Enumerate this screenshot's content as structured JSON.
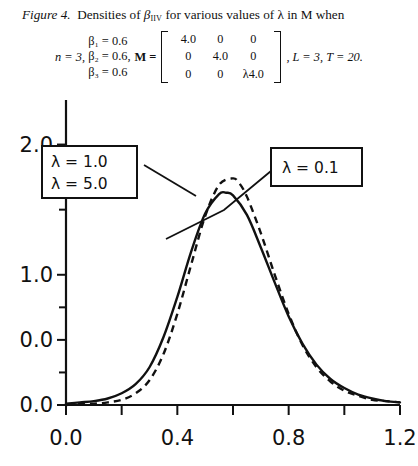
{
  "caption": {
    "figure_number": "Figure 4.",
    "text_before_symbol": "Densities of",
    "symbol_base": "β",
    "symbol_subscript": "IIV",
    "text_after_symbol": "for various values of λ in M when"
  },
  "equation": {
    "n_term": "n = 3,",
    "beta_lines": [
      "β₁ = 0.6",
      "β₂ = 0.6,",
      "β₃ = 0.6"
    ],
    "matrix_label": "M =",
    "matrix": [
      [
        "4.0",
        "0",
        "0"
      ],
      [
        "0",
        "4.0",
        "0"
      ],
      [
        "0",
        "0",
        "λ4.0"
      ]
    ],
    "tail": ", L = 3, T = 20."
  },
  "chart_data": {
    "type": "line",
    "title": "",
    "xlabel": "",
    "ylabel": "",
    "xlim": [
      0.0,
      1.2
    ],
    "ylim": [
      0.0,
      2.25
    ],
    "grid": false,
    "legend_position": "inside-callouts",
    "x_ticks_major": [
      "0.0",
      "0.4",
      "0.8",
      "1.2"
    ],
    "x_tick_values_major": [
      0.0,
      0.4,
      0.8,
      1.2
    ],
    "x_tick_values_minor": [
      0.2,
      0.6,
      1.0
    ],
    "y_ticks_major": [
      "2.0",
      "1.0",
      "0.0",
      "0.0"
    ],
    "y_tick_values_major": [
      2.0,
      1.0,
      0.5,
      0.0
    ],
    "y_tick_values_minor": [
      1.5,
      0.75,
      0.25
    ],
    "series": [
      {
        "name": "λ = 1.0 / λ = 5.0",
        "style": "solid",
        "peak_x": 0.575,
        "peak_y": 1.63,
        "x": [
          0.0,
          0.05,
          0.1,
          0.15,
          0.2,
          0.25,
          0.3,
          0.35,
          0.4,
          0.45,
          0.5,
          0.55,
          0.575,
          0.6,
          0.65,
          0.7,
          0.75,
          0.8,
          0.85,
          0.9,
          0.95,
          1.0,
          1.05,
          1.1,
          1.15,
          1.2
        ],
        "y": [
          0.01,
          0.02,
          0.03,
          0.05,
          0.09,
          0.16,
          0.29,
          0.52,
          0.83,
          1.18,
          1.47,
          1.62,
          1.63,
          1.61,
          1.46,
          1.21,
          0.94,
          0.68,
          0.47,
          0.31,
          0.2,
          0.13,
          0.08,
          0.05,
          0.03,
          0.02
        ]
      },
      {
        "name": "λ = 0.1",
        "style": "dashed",
        "peak_x": 0.598,
        "peak_y": 1.74,
        "x": [
          0.0,
          0.05,
          0.1,
          0.15,
          0.2,
          0.25,
          0.3,
          0.35,
          0.4,
          0.45,
          0.5,
          0.55,
          0.598,
          0.62,
          0.65,
          0.7,
          0.75,
          0.8,
          0.85,
          0.9,
          0.95,
          1.0,
          1.05,
          1.1,
          1.15,
          1.2
        ],
        "y": [
          0.0,
          0.01,
          0.01,
          0.02,
          0.04,
          0.09,
          0.19,
          0.39,
          0.7,
          1.08,
          1.45,
          1.69,
          1.74,
          1.71,
          1.6,
          1.32,
          1.0,
          0.7,
          0.46,
          0.29,
          0.18,
          0.11,
          0.07,
          0.04,
          0.03,
          0.02
        ]
      }
    ],
    "annotations": [
      {
        "name": "lambda-left-callout",
        "lines": [
          "λ = 1.0",
          "λ = 5.0"
        ],
        "points_to": "solid-curve-left-shoulder"
      },
      {
        "name": "lambda-right-callout",
        "lines": [
          "λ = 0.1"
        ],
        "points_to": "dashed-curve-right-shoulder"
      }
    ]
  }
}
